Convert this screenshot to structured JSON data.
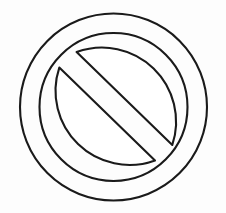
{
  "image": {
    "kind": "line-art-illustration",
    "subject": "prohibition-sign",
    "alt_text": "Black outline drawing of a circular prohibition / no-entry sign with a diagonal bar",
    "width": 226,
    "height": 213,
    "background_color": "#fdfdfd",
    "stroke_color": "#1a1a1a",
    "fill_color": "#ffffff",
    "stroke_width": 2.1,
    "style": "uncolored coloring-book outline, hand-drawn"
  },
  "geometry": {
    "outer_circle": {
      "name": "outer-ring-outline",
      "cx": 113.5,
      "cy": 107.0,
      "r": 93.5
    },
    "inner_circle": {
      "name": "inner-ring-outline",
      "cx": 113.5,
      "cy": 107.0,
      "r": 74.0
    },
    "diagonal_bar": {
      "name": "diagonal-slash-bar",
      "angle_degrees": 45,
      "direction": "upper-left-to-lower-right",
      "half_width": 10.5
    },
    "upper_segment_path": "M 76.6 52.1 L 172.3 144.9 A 74 74 0 0 0 76.6 52.1 Z",
    "lower_segment_path": "M 59.3 67.6 L 155.0 160.4 A 74 74 0 0 1 59.3 67.6 Z"
  },
  "labels": {
    "outer_ring": "Outer ring",
    "inner_ring": "Inner ring",
    "bar": "Diagonal bar",
    "upper_segment": "Upper circle segment",
    "lower_segment": "Lower circle segment"
  }
}
